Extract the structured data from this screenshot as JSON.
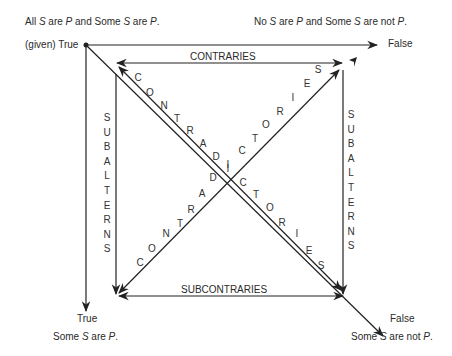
{
  "corners": {
    "top_left": {
      "proposition": [
        "All ",
        "S",
        " are ",
        "P",
        " and Some ",
        "S",
        " are ",
        "P",
        "."
      ],
      "truth_label": "(given) True"
    },
    "top_right": {
      "proposition": [
        "No ",
        "S",
        " are ",
        "P",
        " and Some ",
        "S",
        " are not ",
        "P",
        "."
      ],
      "truth_label": "False"
    },
    "bottom_left": {
      "truth_label": "True",
      "proposition": [
        "Some ",
        "S",
        " are ",
        "P",
        "."
      ]
    },
    "bottom_right": {
      "truth_label": "False",
      "proposition": [
        "Some ",
        "S",
        " are not ",
        "P",
        "."
      ]
    }
  },
  "relations": {
    "top": "CONTRARIES",
    "bottom": "SUBCONTRARIES",
    "left": "SUBALTERNS",
    "right": "SUBALTERNS",
    "diagonal": "CONTRADICTORIES"
  },
  "colors": {
    "line": "#222222",
    "text": "#2a2a2a",
    "background": "#ffffff"
  }
}
